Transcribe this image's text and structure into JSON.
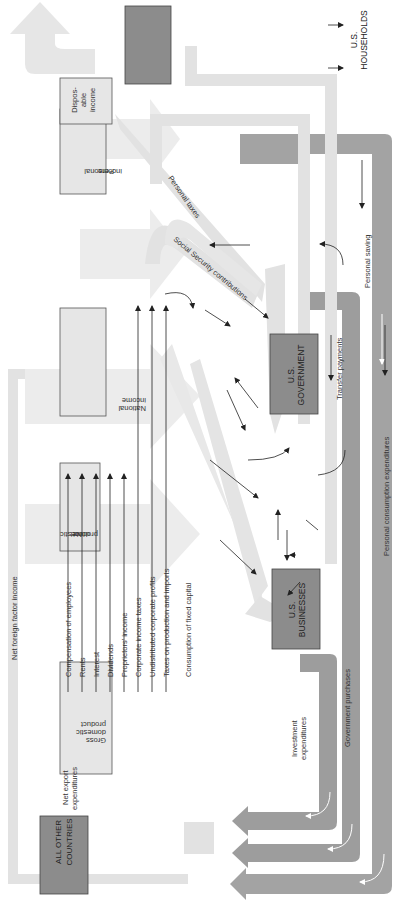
{
  "diagram": {
    "orientation": "rotated 90 degrees counter-clockwise",
    "colors": {
      "light_flow": "#e2e2e2",
      "dark_flow": "#9d9d9d",
      "box_light": "#e6e6e6",
      "box_dark": "#8c8c8c",
      "box_border": "#555555",
      "arrow": "#222222",
      "white_arrow": "#ffffff"
    },
    "sectors": {
      "households": "U.S. HOUSEHOLDS",
      "households_l1": "U.S.",
      "households_l2": "HOUSEHOLDS",
      "government_l1": "U.S.",
      "government_l2": "GOVERNMENT",
      "businesses_l1": "U.S.",
      "businesses_l2": "BUSINESSES",
      "other_l1": "ALL OTHER",
      "other_l2": "COUNTRIES"
    },
    "aggregates": {
      "gdp_l1": "Gross",
      "gdp_l2": "domestic",
      "gdp_l3": "product",
      "ndp_l1": "Net",
      "ndp_l2": "domestic",
      "ndp_l3": "product",
      "ni_l1": "National",
      "ni_l2": "income",
      "pi_l1": "Personal",
      "pi_l2": "income",
      "di_l1": "Dispos-",
      "di_l2": "able",
      "di_l3": "income"
    },
    "income_components": [
      "Compensation of employees",
      "Rents",
      "Interest",
      "Dividends",
      "Proprietors' income",
      "Corporate income taxes",
      "Undistributed corporate profits",
      "Taxes on production and imports",
      "Consumption of fixed capital"
    ],
    "flows": {
      "net_foreign_factor_income": "Net foreign factor income",
      "net_export_l1": "Net export",
      "net_export_l2": "expenditures",
      "investment_l1": "Investment",
      "investment_l2": "expenditures",
      "government_purchases": "Government purchases",
      "personal_consumption": "Personal consumption expenditures",
      "personal_saving": "Personal saving",
      "transfer_payments": "Transfer payments",
      "personal_taxes": "Personal taxes",
      "social_security": "Social Security contributions"
    }
  }
}
